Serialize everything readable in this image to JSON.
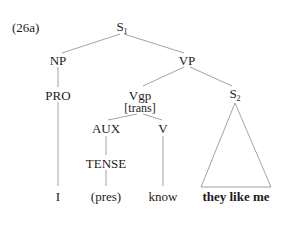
{
  "example_label": "(26a)",
  "nodes": {
    "s1": {
      "label": "S",
      "subscript": "1"
    },
    "np": {
      "label": "NP"
    },
    "vp": {
      "label": "VP"
    },
    "pro": {
      "label": "PRO"
    },
    "vgp": {
      "label": "Vgp",
      "feature": "[trans]"
    },
    "s2": {
      "label": "S",
      "subscript": "2"
    },
    "aux": {
      "label": "AUX"
    },
    "v": {
      "label": "V"
    },
    "tense": {
      "label": "TENSE"
    }
  },
  "leaves": {
    "i": "I",
    "pres": "(pres)",
    "know": "know",
    "s2_content": "they like me"
  },
  "colors": {
    "line": "#8a8a8a",
    "text": "#1c1c1c"
  }
}
